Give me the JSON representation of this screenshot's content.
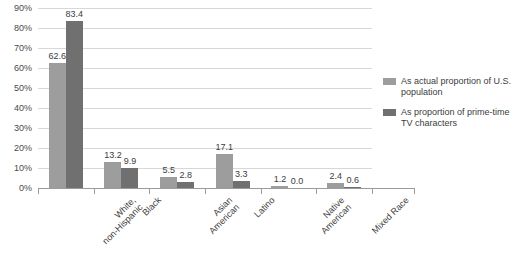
{
  "chart_data": {
    "type": "bar",
    "title": "",
    "subtitle": "",
    "xlabel": "",
    "ylabel": "",
    "ylim": [
      0,
      90
    ],
    "ytick_step": 10,
    "ytick_labels": [
      "0%",
      "10%",
      "20%",
      "30%",
      "40%",
      "50%",
      "60%",
      "70%",
      "80%",
      "90%"
    ],
    "grid": "horizontal",
    "legend_position": "right",
    "value_labels": true,
    "categories": [
      "White,\nnon-Hispanic",
      "Black",
      "Asian\nAmerican",
      "Latino",
      "Native\nAmerican",
      "Mixed Race"
    ],
    "series": [
      {
        "name": "As actual proportion of U.S. population",
        "color": "#9d9d9d",
        "values": [
          62.6,
          13.2,
          5.5,
          17.1,
          1.2,
          2.4
        ],
        "value_labels": [
          "62.6",
          "13.2",
          "5.5",
          "17.1",
          "1.2",
          "2.4"
        ]
      },
      {
        "name": "As proportion of prime-time TV characters",
        "color": "#707070",
        "values": [
          83.4,
          9.9,
          2.8,
          3.3,
          0.0,
          0.6
        ],
        "value_labels": [
          "83.4",
          "9.9",
          "2.8",
          "3.3",
          "0.0",
          "0.6"
        ]
      }
    ]
  },
  "legend": {
    "items": [
      {
        "label": "As actual proportion of U.S. population",
        "color": "#9d9d9d"
      },
      {
        "label": "As proportion of prime-time TV characters",
        "color": "#707070"
      }
    ]
  },
  "colors": {
    "series_actual_population": "#9d9d9d",
    "series_tv_characters": "#707070",
    "gridline": "#d8d8d8",
    "axis": "#9b9b9b",
    "text": "#3c3c3c",
    "background": "#ffffff"
  }
}
